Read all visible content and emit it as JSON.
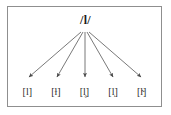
{
  "diagram": {
    "type": "phoneme-allophone-tree",
    "title": "",
    "phoneme": {
      "label": "/l/",
      "name": "phoneme-l"
    },
    "allophones": [
      {
        "label": "[l]",
        "name": "allophone-clear-l"
      },
      {
        "label": "[ɫ]",
        "name": "allophone-dark-l"
      },
      {
        "label": "[l̥]",
        "name": "allophone-voiceless-l"
      },
      {
        "label": "[l̩]",
        "name": "allophone-syllabic-l"
      },
      {
        "label": "[l̴]",
        "name": "allophone-velarized-l"
      }
    ],
    "arrows": {
      "count": 5,
      "origin": {
        "x": 85,
        "y": 31
      },
      "tips": [
        {
          "x": 29,
          "y": 79
        },
        {
          "x": 57,
          "y": 79
        },
        {
          "x": 85,
          "y": 79
        },
        {
          "x": 113,
          "y": 79
        },
        {
          "x": 141,
          "y": 79
        }
      ]
    },
    "colors": {
      "background": "#ffffff",
      "border": "#8f8f8f",
      "text": "#1c1c1c",
      "arrow": "#555555"
    }
  }
}
